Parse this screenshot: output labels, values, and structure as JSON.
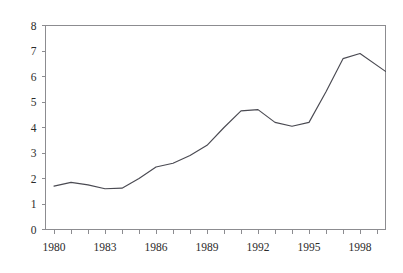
{
  "figure": {
    "background_color": "#ffffff",
    "line_color": "#4a4a52",
    "axis_color": "#8c8c90",
    "text_color": "#2b2b2b",
    "clipped_top_caption": ""
  },
  "chart_data": {
    "type": "line",
    "title": "",
    "subtitle": "",
    "xlabel": "",
    "ylabel": "",
    "xlim": [
      1979.5,
      1999.5
    ],
    "ylim": [
      0,
      8
    ],
    "grid": false,
    "legend": false,
    "legend_position": "none",
    "y_ticks": [
      0,
      1,
      2,
      3,
      4,
      5,
      6,
      7,
      8
    ],
    "y_tick_labels": [
      "0",
      "1",
      "2",
      "3",
      "4",
      "5",
      "6",
      "7",
      "8"
    ],
    "x_ticks": [
      1980,
      1981,
      1982,
      1983,
      1984,
      1985,
      1986,
      1987,
      1988,
      1989,
      1990,
      1991,
      1992,
      1993,
      1994,
      1995,
      1996,
      1997,
      1998,
      1999
    ],
    "x_tick_labels_shown": [
      "1980",
      "1983",
      "1986",
      "1989",
      "1992",
      "1995",
      "1998"
    ],
    "x_labeled_ticks": [
      1980,
      1983,
      1986,
      1989,
      1992,
      1995,
      1998
    ],
    "x": [
      1980,
      1981,
      1982,
      1983,
      1984,
      1985,
      1986,
      1987,
      1988,
      1989,
      1990,
      1991,
      1992,
      1993,
      1994,
      1995,
      1996,
      1997,
      1998,
      1999.5
    ],
    "values": [
      1.7,
      1.85,
      1.75,
      1.6,
      1.62,
      2.0,
      2.45,
      2.6,
      2.9,
      3.3,
      4.0,
      4.65,
      4.7,
      4.2,
      4.05,
      4.2,
      5.4,
      6.7,
      6.9,
      6.2
    ],
    "series": [
      {
        "name": "series-1",
        "values": [
          1.7,
          1.85,
          1.75,
          1.6,
          1.62,
          2.0,
          2.45,
          2.6,
          2.9,
          3.3,
          4.0,
          4.65,
          4.7,
          4.2,
          4.05,
          4.2,
          5.4,
          6.7,
          6.9,
          6.2
        ]
      }
    ],
    "annotations": []
  }
}
